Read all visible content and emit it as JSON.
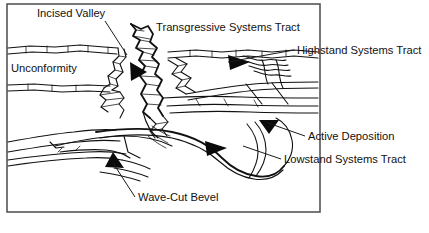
{
  "figure": {
    "type": "geological-cross-section-diagram",
    "background_color": "#ffffff",
    "ink_color": "#111111",
    "frame_color": "#555555"
  },
  "frame": {
    "x": 7,
    "y": 4,
    "width": 313,
    "height": 208
  },
  "labels": [
    {
      "id": "incised-valley",
      "text": "Incised Valley",
      "x": 37,
      "y": 17,
      "anchor": "start"
    },
    {
      "id": "transgressive-systems-tract",
      "text": "Transgressive Systems Tract",
      "x": 156,
      "y": 31,
      "anchor": "start"
    },
    {
      "id": "highstand-systems-tract",
      "text": "Highstand Systems Tract",
      "x": 297,
      "y": 54,
      "anchor": "start"
    },
    {
      "id": "unconformity",
      "text": "Unconformity",
      "x": 11,
      "y": 72,
      "anchor": "start"
    },
    {
      "id": "active-deposition",
      "text": "Active Deposition",
      "x": 308,
      "y": 140,
      "anchor": "start"
    },
    {
      "id": "lowstand-systems-tract",
      "text": "Lowstand Systems Tract",
      "x": 284,
      "y": 163,
      "anchor": "start"
    },
    {
      "id": "wave-cut-bevel",
      "text": "Wave-Cut Bevel",
      "x": 138,
      "y": 201,
      "anchor": "start"
    }
  ],
  "annotations": {
    "leaders": [
      {
        "id": "incised-valley-leader",
        "path": "M 105 21 L 127 55"
      },
      {
        "id": "highstand-leader",
        "path": "M 294 50 L 228 62"
      },
      {
        "id": "active-deposition-leader",
        "path": "M 305 136 L 268 123"
      },
      {
        "id": "lowstand-leader",
        "path": "M 281 159 L 243 146"
      },
      {
        "id": "wave-cut-bevel-leader",
        "path": "M 135 197 L 113 163"
      }
    ],
    "arrowheads": [
      {
        "id": "incised-valley-arrow",
        "points": "130,62 147,72 131,81",
        "direction": "down-right"
      },
      {
        "id": "transgressive-arrow",
        "points": "228,55 250,62 230,70",
        "direction": "left"
      },
      {
        "id": "lowstand-arrow",
        "points": "205,141 227,148 207,156",
        "direction": "left"
      },
      {
        "id": "active-deposition-arrow",
        "points": "259,120 279,120 269,134",
        "direction": "down"
      },
      {
        "id": "wave-cut-bevel-arrow",
        "points": "113,152 124,168 105,167",
        "direction": "up-left"
      }
    ]
  }
}
